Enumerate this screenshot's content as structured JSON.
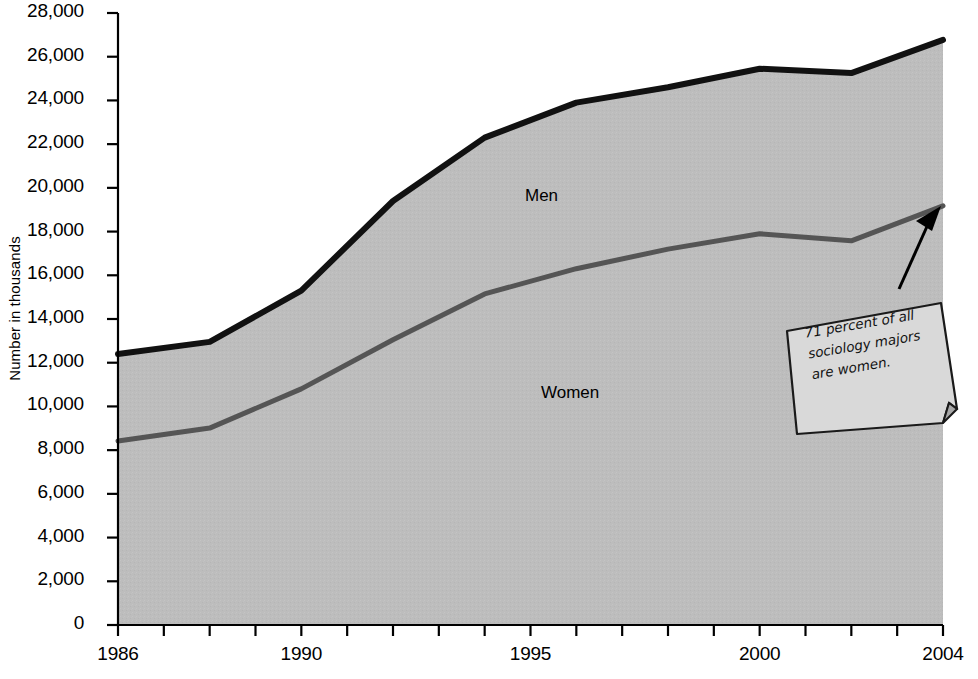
{
  "chart_data": {
    "type": "area",
    "title": "",
    "xlabel": "",
    "ylabel": "Number in thousands",
    "xlim": [
      1986,
      2004
    ],
    "ylim": [
      0,
      28000
    ],
    "ytick_step": 2000,
    "grid": false,
    "legend_position": "inline-labels",
    "x": [
      1986,
      1988,
      1990,
      1992,
      1994,
      1996,
      1998,
      2000,
      2002,
      2004
    ],
    "xtick_years": [
      1986,
      1987,
      1988,
      1989,
      1990,
      1991,
      1992,
      1993,
      1994,
      1995,
      1996,
      1997,
      1998,
      1999,
      2000,
      2001,
      2002,
      2003,
      2004
    ],
    "xtick_labels_shown": [
      "1986",
      "1990",
      "1995",
      "2000",
      "2004"
    ],
    "ytick_labels": [
      "0",
      "2,000",
      "4,000",
      "6,000",
      "8,000",
      "10,000",
      "12,000",
      "14,000",
      "16,000",
      "18,000",
      "20,000",
      "22,000",
      "24,000",
      "26,000",
      "28,000"
    ],
    "series": [
      {
        "name": "Women",
        "kind": "lower-band",
        "color": "#555555",
        "fill": "#bdbdbd",
        "label": "Women",
        "values": [
          8420,
          9010,
          10800,
          13050,
          15150,
          16300,
          17200,
          17900,
          17580,
          19180
        ]
      },
      {
        "name": "Men",
        "kind": "upper-band-total",
        "color": "#111111",
        "fill": "#bdbdbd",
        "label": "Men",
        "values": [
          12400,
          12950,
          15300,
          19400,
          22300,
          23900,
          24600,
          25450,
          25250,
          26770
        ]
      }
    ],
    "annotations": [
      {
        "name": "callout",
        "text_lines": [
          "71 percent of all",
          "sociology majors",
          "are women."
        ],
        "points_to_year": 2004,
        "points_to_series": "Women"
      }
    ]
  },
  "labels": {
    "men": "Men",
    "women": "Women",
    "y_axis_title": "Number in thousands"
  },
  "callout": {
    "line1": "71 percent of all",
    "line2": "sociology majors",
    "line3": "are women."
  },
  "colors": {
    "area_fill": "#bdbdbd",
    "total_line": "#111111",
    "women_line": "#555555",
    "axis": "#000000",
    "callout_bg": "#d9d9d9",
    "callout_border": "#1a1a1a"
  }
}
